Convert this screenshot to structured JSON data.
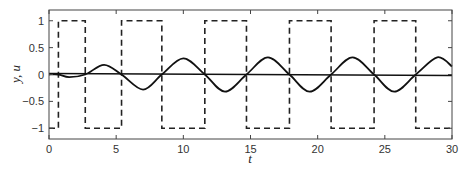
{
  "chart_data": {
    "type": "line",
    "title": "",
    "xlabel": "t",
    "ylabel": "y, u",
    "xlim": [
      0,
      30
    ],
    "ylim": [
      -1.2,
      1.2
    ],
    "grid": false,
    "legend": null,
    "xticks": [
      0,
      5,
      10,
      15,
      20,
      25,
      30
    ],
    "xtick_labels": [
      "0",
      "5",
      "10",
      "15",
      "20",
      "25",
      "30"
    ],
    "yticks": [
      1,
      0.5,
      0,
      -0.5,
      -1
    ],
    "ytick_labels": [
      "1",
      "0.5",
      "0",
      "−0.5",
      "−1"
    ],
    "series": [
      {
        "name": "u",
        "style": "dashed",
        "kind": "square-wave",
        "initial_value": -1,
        "switch_times": [
          0.7,
          2.7,
          5.4,
          8.4,
          11.6,
          14.7,
          17.9,
          21.0,
          24.2,
          27.3
        ],
        "levels_after_switch": [
          1,
          -1,
          1,
          -1,
          1,
          -1,
          1,
          -1,
          1,
          -1
        ]
      },
      {
        "name": "y",
        "style": "solid",
        "kind": "oscillation",
        "x": [
          0,
          0.7,
          1.5,
          2.7,
          4.1,
          5.4,
          7.0,
          8.4,
          10.0,
          11.6,
          13.1,
          14.7,
          16.3,
          17.9,
          19.4,
          21.0,
          22.6,
          24.2,
          25.7,
          27.3,
          28.9,
          30
        ],
        "values": [
          0.0,
          0.0,
          -0.05,
          0.0,
          0.18,
          0.0,
          -0.28,
          0.0,
          0.3,
          0.0,
          -0.32,
          0.0,
          0.32,
          0.0,
          -0.32,
          0.0,
          0.32,
          0.0,
          -0.32,
          0.0,
          0.32,
          0.15
        ]
      },
      {
        "name": "reference",
        "style": "solid",
        "kind": "line",
        "x": [
          0,
          30
        ],
        "values": [
          0.02,
          -0.02
        ]
      }
    ]
  }
}
